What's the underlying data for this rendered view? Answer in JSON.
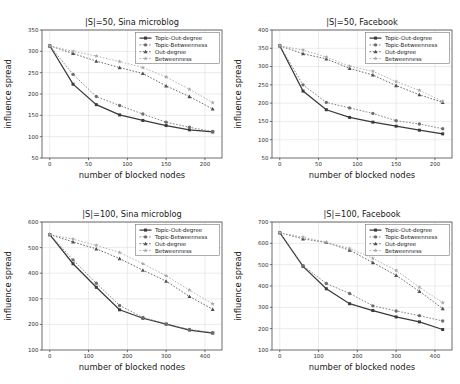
{
  "figure": {
    "name": "influence-spread-blocked-nodes-figure",
    "background": "#ffffff",
    "panel_count": 4
  },
  "common": {
    "xlabel": "number of blocked nodes",
    "ylabel": "influence spread",
    "legend_position": "upper right",
    "grid": true,
    "series_names": [
      "Topic-Out-degree",
      "Topic-Betweenness",
      "Out-degree",
      "Betweenness"
    ],
    "series_markers": [
      "square",
      "circle",
      "triangle",
      "star"
    ],
    "series_linestyles": [
      "solid",
      "dotted",
      "dotted",
      "dotted"
    ],
    "series_colors": [
      "#3a3a3a",
      "#6e6e6e",
      "#505050",
      "#a8a8a8"
    ]
  },
  "chart_data": [
    {
      "id": "panel-top-left",
      "type": "line",
      "title": "|S|=50, Sina microblog",
      "xlabel": "number of blocked nodes",
      "ylabel": "influence spread",
      "x": [
        0,
        30,
        60,
        90,
        120,
        150,
        180,
        210
      ],
      "xticks": [
        0,
        50,
        100,
        150,
        200
      ],
      "yticks": [
        50,
        100,
        150,
        200,
        250,
        300,
        350
      ],
      "xlim": [
        -10,
        222
      ],
      "ylim": [
        50,
        350
      ],
      "legend": [
        "Topic-Out-degree",
        "Topic-Betweenness",
        "Out-degree",
        "Betweenness"
      ],
      "series": [
        {
          "name": "Topic-Out-degree",
          "values": [
            313,
            223,
            175,
            151,
            138,
            126,
            116,
            111
          ]
        },
        {
          "name": "Topic-Betweenness",
          "values": [
            313,
            246,
            194,
            173,
            153,
            134,
            122,
            112
          ]
        },
        {
          "name": "Out-degree",
          "values": [
            313,
            295,
            277,
            262,
            248,
            219,
            194,
            165
          ]
        },
        {
          "name": "Betweenness",
          "values": [
            313,
            300,
            289,
            276,
            262,
            240,
            211,
            180
          ]
        }
      ]
    },
    {
      "id": "panel-top-right",
      "type": "line",
      "title": "|S|=50, Facebook",
      "xlabel": "number of blocked nodes",
      "ylabel": "influence spread",
      "x": [
        0,
        30,
        60,
        90,
        120,
        150,
        180,
        210
      ],
      "xticks": [
        0,
        50,
        100,
        150,
        200
      ],
      "yticks": [
        50,
        100,
        150,
        200,
        250,
        300,
        350,
        400
      ],
      "xlim": [
        -10,
        222
      ],
      "ylim": [
        50,
        400
      ],
      "legend": [
        "Topic-Out-degree",
        "Topic-Betweenness",
        "Out-degree",
        "Betweenness"
      ],
      "series": [
        {
          "name": "Topic-Out-degree",
          "values": [
            357,
            233,
            182,
            161,
            148,
            137,
            126,
            116
          ]
        },
        {
          "name": "Topic-Betweenness",
          "values": [
            357,
            250,
            202,
            187,
            172,
            152,
            143,
            130
          ]
        },
        {
          "name": "Out-degree",
          "values": [
            357,
            335,
            321,
            295,
            277,
            248,
            223,
            202
          ]
        },
        {
          "name": "Betweenness",
          "values": [
            357,
            345,
            326,
            301,
            287,
            259,
            235,
            205
          ]
        }
      ]
    },
    {
      "id": "panel-bottom-left",
      "type": "line",
      "title": "|S|=100, Sina microblog",
      "xlabel": "number of blocked nodes",
      "ylabel": "influence spread",
      "x": [
        0,
        60,
        120,
        180,
        240,
        300,
        360,
        420
      ],
      "xticks": [
        0,
        100,
        200,
        300,
        400
      ],
      "yticks": [
        100,
        200,
        300,
        400,
        500,
        600
      ],
      "xlim": [
        -20,
        444
      ],
      "ylim": [
        100,
        600
      ],
      "legend": [
        "Topic-Out-degree",
        "Topic-Betweenness",
        "Out-degree",
        "Betweenness"
      ],
      "series": [
        {
          "name": "Topic-Out-degree",
          "values": [
            551,
            437,
            345,
            257,
            224,
            201,
            178,
            166
          ]
        },
        {
          "name": "Topic-Betweenness",
          "values": [
            551,
            452,
            361,
            274,
            227,
            202,
            180,
            168
          ]
        },
        {
          "name": "Out-degree",
          "values": [
            551,
            522,
            495,
            457,
            412,
            369,
            309,
            259
          ]
        },
        {
          "name": "Betweenness",
          "values": [
            551,
            533,
            509,
            481,
            437,
            390,
            334,
            280
          ]
        }
      ]
    },
    {
      "id": "panel-bottom-right",
      "type": "line",
      "title": "|S|=100, Facebook",
      "xlabel": "number of blocked nodes",
      "ylabel": "influence spread",
      "x": [
        0,
        60,
        120,
        180,
        240,
        300,
        360,
        420
      ],
      "xticks": [
        0,
        100,
        200,
        300,
        400
      ],
      "yticks": [
        100,
        200,
        300,
        400,
        500,
        600,
        700
      ],
      "xlim": [
        -20,
        444
      ],
      "ylim": [
        100,
        700
      ],
      "legend": [
        "Topic-Out-degree",
        "Topic-Betweenness",
        "Out-degree",
        "Betweenness"
      ],
      "series": [
        {
          "name": "Topic-Out-degree",
          "values": [
            650,
            492,
            387,
            317,
            285,
            255,
            232,
            196
          ]
        },
        {
          "name": "Topic-Betweenness",
          "values": [
            650,
            495,
            412,
            365,
            307,
            283,
            261,
            236
          ]
        },
        {
          "name": "Out-degree",
          "values": [
            650,
            621,
            604,
            568,
            510,
            450,
            375,
            294
          ]
        },
        {
          "name": "Betweenness",
          "values": [
            650,
            629,
            605,
            576,
            530,
            473,
            394,
            322
          ]
        }
      ]
    }
  ]
}
